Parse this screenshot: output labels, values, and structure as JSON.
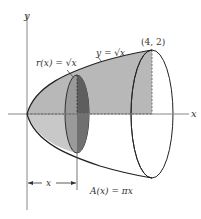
{
  "figure": {
    "axes": {
      "x_label": "x",
      "y_label": "y"
    },
    "curve_label": "y = √x",
    "curve_label_parts": {
      "lhs": "y = ",
      "rhs": "√x"
    },
    "radius_label": "r(x) = √x",
    "radius_label_parts": {
      "lhs": "r(x) = ",
      "rhs": "√x"
    },
    "endpoint_label": "(4, 2)",
    "distance_label": "x",
    "area_label": "A(x) = πx",
    "colors": {
      "solid_fill": "#b4b4b4",
      "slice_fill": "#8c8c8c",
      "slice_dark_fill": "#6e6e6e",
      "outline": "#222222",
      "axis": "#888888"
    }
  }
}
